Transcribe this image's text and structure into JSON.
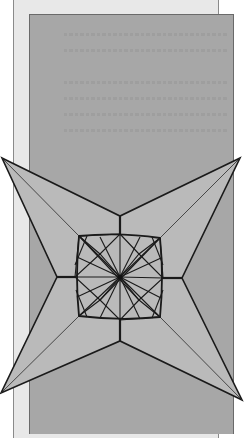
{
  "figure": {
    "type": "origami-diagram",
    "colors": {
      "background": "#ffffff",
      "page": "#e8e8e8",
      "panel": "#a7a7a7",
      "star_fill": "#bababa",
      "line": "#1a1a1a"
    },
    "star": {
      "tips": [
        [
          2,
          158
        ],
        [
          240,
          158
        ],
        [
          242,
          400
        ],
        [
          1,
          393
        ]
      ],
      "inner_vertices": [
        [
          120,
          216
        ],
        [
          182,
          278
        ],
        [
          120,
          341
        ],
        [
          57,
          277
        ]
      ],
      "center": [
        120,
        277
      ],
      "square": [
        [
          79,
          236
        ],
        [
          160,
          238
        ],
        [
          160,
          317
        ],
        [
          79,
          316
        ]
      ]
    }
  }
}
